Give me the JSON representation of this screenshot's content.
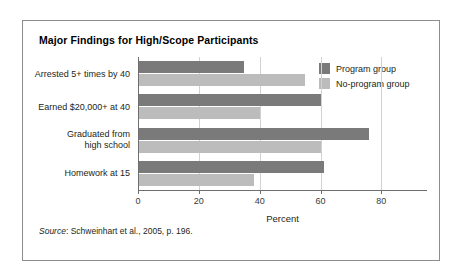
{
  "figure": {
    "title": "Major Findings for High/Scope Participants",
    "source_prefix": "Source",
    "source_text": ": Schweinhart et al., 2005, p. 196."
  },
  "colors": {
    "program": "#7a7a7a",
    "no_program": "#bcbcbc",
    "frame": "#8d8d8d",
    "axis": "#6e6e6e",
    "gridline": "#d2d2d2"
  },
  "legend": {
    "position": "top-right",
    "items": [
      {
        "label": "Program group",
        "color": "#7a7a7a"
      },
      {
        "label": "No-program group",
        "color": "#bcbcbc"
      }
    ]
  },
  "chart_data": {
    "type": "bar",
    "orientation": "horizontal",
    "title": "Major Findings for High/Scope Participants",
    "xlabel": "Percent",
    "ylabel": "",
    "xlim": [
      0,
      95
    ],
    "xticks": [
      0,
      20,
      40,
      60,
      80
    ],
    "xtick_labels": [
      "0",
      "20",
      "40",
      "60",
      "80"
    ],
    "grid": true,
    "grid_axis": "x",
    "legend_position": "top-right",
    "categories": [
      "Arrested 5+ times by 40",
      "Earned $20,000+ at 40",
      "Graduated from\nhigh school",
      "Homework at 15"
    ],
    "category_lines": [
      [
        "Arrested 5+ times by 40"
      ],
      [
        "Earned $20,000+ at 40"
      ],
      [
        "Graduated from",
        "high school"
      ],
      [
        "Homework at 15"
      ]
    ],
    "series": [
      {
        "name": "Program group",
        "color": "#7a7a7a",
        "values": [
          35,
          60,
          76,
          61
        ]
      },
      {
        "name": "No-program group",
        "color": "#bcbcbc",
        "values": [
          55,
          40,
          60,
          38
        ]
      }
    ],
    "units": "percent"
  }
}
